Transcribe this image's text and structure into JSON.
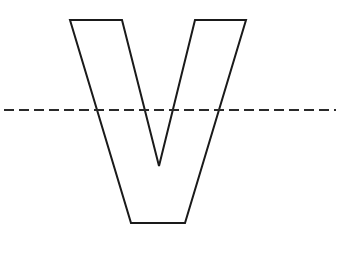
{
  "diagram": {
    "type": "letter-outline-with-symmetry-line",
    "shape": {
      "letter": "V",
      "stroke": "#1a1a1a",
      "fill": "none",
      "stroke_width": 2,
      "points": [
        [
          70,
          20
        ],
        [
          122,
          20
        ],
        [
          159,
          166
        ],
        [
          195,
          20
        ],
        [
          246,
          20
        ],
        [
          185,
          223
        ],
        [
          131,
          223
        ]
      ]
    },
    "dashed_line": {
      "orientation": "horizontal",
      "x1": 4,
      "x2": 336,
      "y": 110,
      "stroke": "#2a2a2a",
      "stroke_width": 2,
      "dash": "10 5"
    }
  }
}
